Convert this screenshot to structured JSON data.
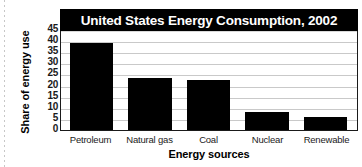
{
  "chart_data": {
    "type": "bar",
    "title": "United States Energy Consumption, 2002",
    "xlabel": "Energy sources",
    "ylabel": "Share of energy use",
    "categories": [
      "Petroleum",
      "Natural gas",
      "Coal",
      "Nuclear",
      "Renewable"
    ],
    "values": [
      39,
      23.5,
      22.5,
      8,
      6
    ],
    "ylim": [
      0,
      45
    ],
    "yticks": [
      45,
      40,
      35,
      30,
      25,
      20,
      15,
      10,
      5,
      0
    ],
    "grid": true,
    "legend": "none",
    "bar_color": "#000000",
    "title_background": "#000000",
    "title_color": "#ffffff",
    "gridline_color": "#c9c9c9",
    "plot_background": "#ffffff"
  }
}
